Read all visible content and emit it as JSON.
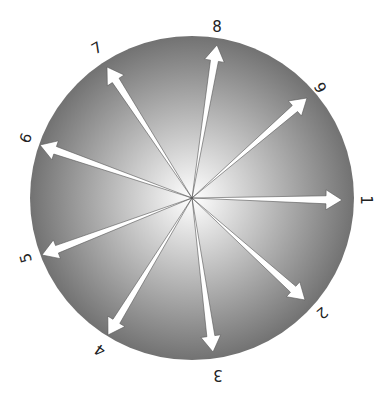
{
  "diagram": {
    "type": "radial-arrow-dial",
    "center": [
      192,
      198
    ],
    "radius": 162,
    "colors": {
      "edge": "#727272",
      "center": "#ffffff",
      "arrow": "#ffffff",
      "arrow_outline": "#555555",
      "label": "#222222"
    },
    "arrows": [
      {
        "label": "1",
        "tip": [
          342,
          200
        ],
        "label_pos": [
          366,
          200
        ],
        "label_rot": 90
      },
      {
        "label": "2",
        "tip": [
          305,
          300
        ],
        "label_pos": [
          322,
          313
        ],
        "label_rot": 140
      },
      {
        "label": "3",
        "tip": [
          213,
          352
        ],
        "label_pos": [
          218,
          375
        ],
        "label_rot": 180
      },
      {
        "label": "4",
        "tip": [
          108,
          335
        ],
        "label_pos": [
          100,
          350
        ],
        "label_rot": 215
      },
      {
        "label": "5",
        "tip": [
          42,
          255
        ],
        "label_pos": [
          26,
          258
        ],
        "label_rot": 255
      },
      {
        "label": "6",
        "tip": [
          40,
          145
        ],
        "label_pos": [
          26,
          138
        ],
        "label_rot": 290
      },
      {
        "label": "7",
        "tip": [
          107,
          67
        ],
        "label_pos": [
          97,
          48
        ],
        "label_rot": 330
      },
      {
        "label": "8",
        "tip": [
          217,
          45
        ],
        "label_pos": [
          217,
          27
        ],
        "label_rot": 0
      },
      {
        "label": "9",
        "tip": [
          307,
          98
        ],
        "label_pos": [
          320,
          88
        ],
        "label_rot": 60
      }
    ]
  }
}
